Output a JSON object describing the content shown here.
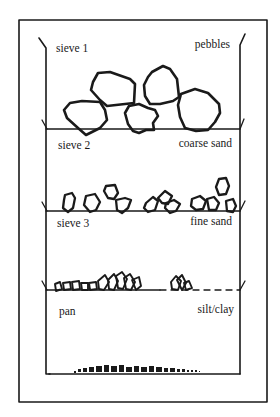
{
  "diagram": {
    "type": "sieve-stack",
    "colors": {
      "ink": "#1a1a1a",
      "background": "#ffffff"
    },
    "layers": [
      {
        "sieve": "sieve 1",
        "material": "pebbles"
      },
      {
        "sieve": "sieve 2",
        "material": "coarse sand"
      },
      {
        "sieve": "sieve 3",
        "material": "fine sand"
      },
      {
        "sieve": "pan",
        "material": "silt/clay"
      }
    ]
  }
}
